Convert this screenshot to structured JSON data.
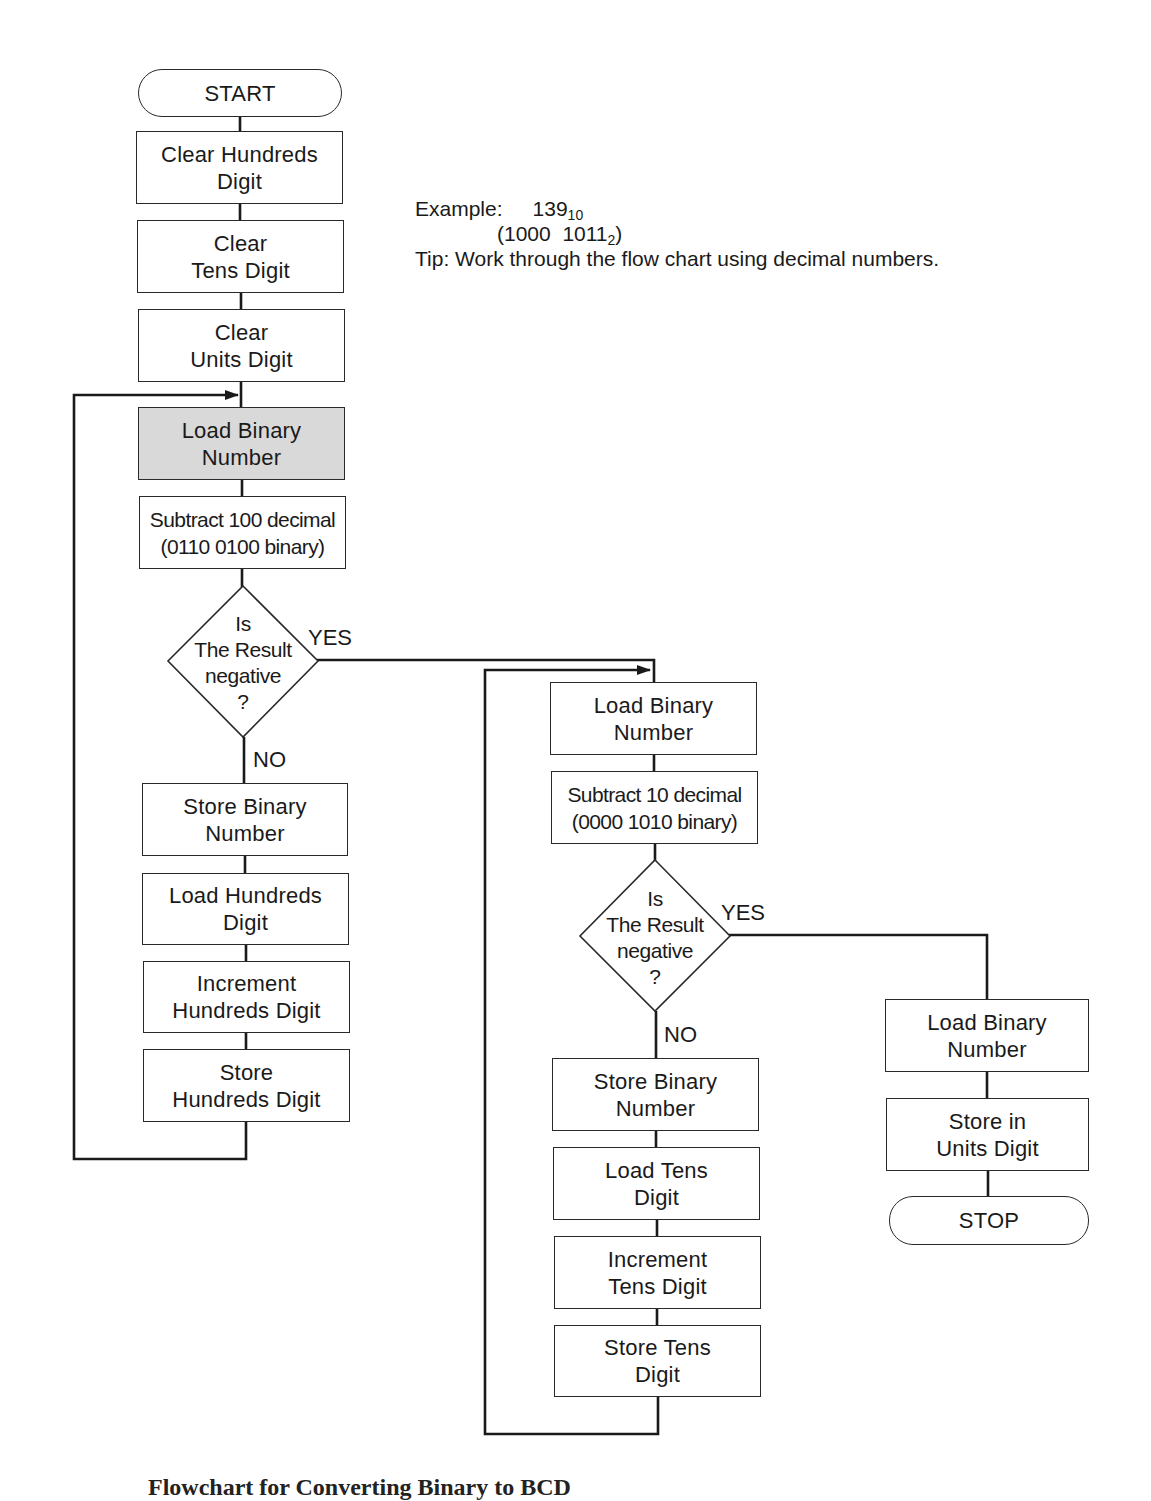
{
  "diagram": {
    "type": "flowchart",
    "caption": "Flowchart for Converting Binary to BCD",
    "note": {
      "example_label": "Example:",
      "example_decimal": "139",
      "example_decimal_base": "10",
      "example_binary": "(1000  1011",
      "example_binary_base": "2",
      "example_binary_close": ")",
      "tip": "Tip: Work through the flow chart using decimal numbers."
    },
    "nodes": {
      "start": {
        "shape": "terminator",
        "lines": [
          "START"
        ]
      },
      "clear_hundreds": {
        "shape": "process",
        "lines": [
          "Clear Hundreds",
          "Digit"
        ]
      },
      "clear_tens": {
        "shape": "process",
        "lines": [
          "Clear",
          "Tens Digit"
        ]
      },
      "clear_units": {
        "shape": "process",
        "lines": [
          "Clear",
          "Units Digit"
        ]
      },
      "load_binary_1": {
        "shape": "process",
        "highlighted": true,
        "lines": [
          "Load Binary",
          "Number"
        ]
      },
      "subtract_100": {
        "shape": "process",
        "lines": [
          "Subtract 100 decimal",
          "(0110 0100 binary)"
        ]
      },
      "decision_1": {
        "shape": "decision",
        "lines": [
          "Is",
          "The Result",
          "negative",
          "?"
        ]
      },
      "store_binary_1": {
        "shape": "process",
        "lines": [
          "Store Binary",
          "Number"
        ]
      },
      "load_hundreds": {
        "shape": "process",
        "lines": [
          "Load Hundreds",
          "Digit"
        ]
      },
      "increment_hundreds": {
        "shape": "process",
        "lines": [
          "Increment",
          "Hundreds Digit"
        ]
      },
      "store_hundreds": {
        "shape": "process",
        "lines": [
          "Store",
          "Hundreds Digit"
        ]
      },
      "load_binary_2": {
        "shape": "process",
        "lines": [
          "Load Binary",
          "Number"
        ]
      },
      "subtract_10": {
        "shape": "process",
        "lines": [
          "Subtract 10 decimal",
          "(0000 1010 binary)"
        ]
      },
      "decision_2": {
        "shape": "decision",
        "lines": [
          "Is",
          "The Result",
          "negative",
          "?"
        ]
      },
      "store_binary_2": {
        "shape": "process",
        "lines": [
          "Store Binary",
          "Number"
        ]
      },
      "load_tens": {
        "shape": "process",
        "lines": [
          "Load Tens",
          "Digit"
        ]
      },
      "increment_tens": {
        "shape": "process",
        "lines": [
          "Increment",
          "Tens Digit"
        ]
      },
      "store_tens": {
        "shape": "process",
        "lines": [
          "Store Tens",
          "Digit"
        ]
      },
      "load_binary_3": {
        "shape": "process",
        "lines": [
          "Load Binary",
          "Number"
        ]
      },
      "store_units": {
        "shape": "process",
        "lines": [
          "Store in",
          "Units Digit"
        ]
      },
      "stop": {
        "shape": "terminator",
        "lines": [
          "STOP"
        ]
      }
    },
    "edge_labels": {
      "d1_yes": "YES",
      "d1_no": "NO",
      "d2_yes": "YES",
      "d2_no": "NO"
    },
    "edges": [
      [
        "start",
        "clear_hundreds"
      ],
      [
        "clear_hundreds",
        "clear_tens"
      ],
      [
        "clear_tens",
        "clear_units"
      ],
      [
        "clear_units",
        "load_binary_1"
      ],
      [
        "load_binary_1",
        "subtract_100"
      ],
      [
        "subtract_100",
        "decision_1"
      ],
      [
        "decision_1",
        "load_binary_2",
        "YES"
      ],
      [
        "decision_1",
        "store_binary_1",
        "NO"
      ],
      [
        "store_binary_1",
        "load_hundreds"
      ],
      [
        "load_hundreds",
        "increment_hundreds"
      ],
      [
        "increment_hundreds",
        "store_hundreds"
      ],
      [
        "store_hundreds",
        "load_binary_1"
      ],
      [
        "load_binary_2",
        "subtract_10"
      ],
      [
        "subtract_10",
        "decision_2"
      ],
      [
        "decision_2",
        "load_binary_3",
        "YES"
      ],
      [
        "decision_2",
        "store_binary_2",
        "NO"
      ],
      [
        "store_binary_2",
        "load_tens"
      ],
      [
        "load_tens",
        "increment_tens"
      ],
      [
        "increment_tens",
        "store_tens"
      ],
      [
        "store_tens",
        "load_binary_2"
      ],
      [
        "load_binary_3",
        "store_units"
      ],
      [
        "store_units",
        "stop"
      ]
    ],
    "colors": {
      "line": "#1a1a1a",
      "highlight_fill": "#d9d9d9",
      "background": "#ffffff"
    }
  }
}
